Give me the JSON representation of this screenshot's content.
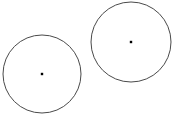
{
  "figure": {
    "title": "",
    "background_color": "#ffffff",
    "width": 179,
    "height": 120,
    "stroke_color": "#4a4a4a",
    "stroke_width": 1,
    "center_dot_color": "#000000",
    "center_dot_size": 2.4
  },
  "chart_data": {
    "type": "scatter",
    "title": "",
    "subtitle": "",
    "xlabel": "",
    "ylabel": "",
    "grid": false,
    "legend": null,
    "axis_visible": false,
    "tick_labels": [],
    "annotations": [],
    "xlim": [
      0,
      179
    ],
    "ylim": [
      0,
      120
    ],
    "shapes": [
      {
        "name": "left-circle",
        "kind": "circle",
        "cx": 42,
        "cy": 74,
        "r": 39,
        "stroke": "#4a4a4a",
        "stroke_width": 1,
        "fill": "none",
        "label": "",
        "center_marker": true
      },
      {
        "name": "right-circle",
        "kind": "circle",
        "cx": 131,
        "cy": 42,
        "r": 40,
        "stroke": "#4a4a4a",
        "stroke_width": 1,
        "fill": "none",
        "label": "",
        "center_marker": true
      }
    ],
    "points": [
      {
        "name": "left-circle-center",
        "x": 42,
        "y": 74
      },
      {
        "name": "right-circle-center",
        "x": 131,
        "y": 42
      }
    ]
  }
}
